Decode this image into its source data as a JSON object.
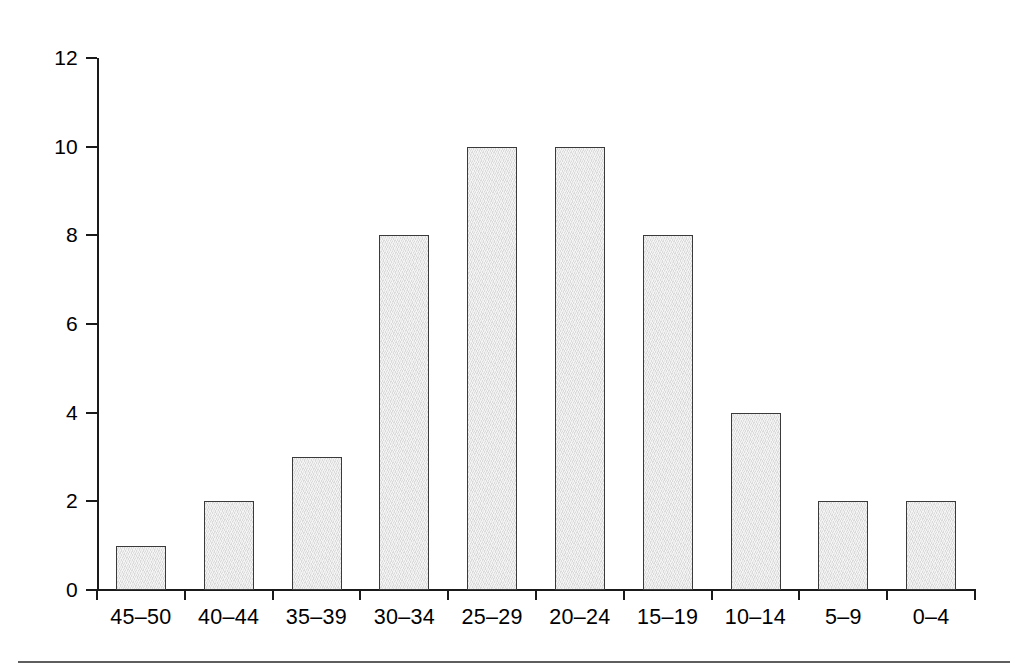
{
  "figure": {
    "background_color": "#ffffff",
    "axis_color": "#1a1a1a",
    "bar_fill_color": "#e3e3e3",
    "bar_border_color": "#3a3a3a",
    "rule_color": "#5e5e5e"
  },
  "chart_data": {
    "type": "bar",
    "title": "",
    "subtitle": "",
    "xlabel": "",
    "ylabel": "",
    "categories": [
      "45–50",
      "40–44",
      "35–39",
      "30–34",
      "25–29",
      "20–24",
      "15–19",
      "10–14",
      "5–9",
      "0–4"
    ],
    "values": [
      1,
      2,
      3,
      8,
      10,
      10,
      8,
      4,
      2,
      2
    ],
    "ylim": [
      0,
      12
    ],
    "xlim": [
      0,
      10
    ],
    "y_ticks": [
      0,
      2,
      4,
      6,
      8,
      10,
      12
    ],
    "y_tick_labels": [
      "0",
      "2",
      "4",
      "6",
      "8",
      "10",
      "12"
    ],
    "grid": false,
    "legend": null,
    "legend_position": "none",
    "annotations": []
  },
  "decorations": {
    "bottom_rule_present": true
  }
}
